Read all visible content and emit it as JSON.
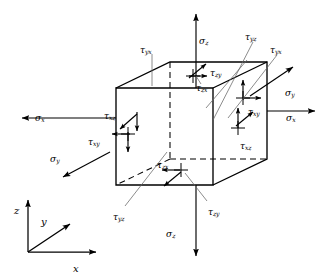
{
  "figure": {
    "type": "stress-element-diagram",
    "background_color": "#ffffff",
    "line_color": "#000000",
    "leader_color": "#555555"
  },
  "axes": {
    "name": "coordinate-triad",
    "origin": {
      "x": 28,
      "y": 252
    },
    "labels": [
      {
        "id": "z",
        "base": "z",
        "sub": "",
        "x": 14,
        "y": 206,
        "dir": "up"
      },
      {
        "id": "y",
        "base": "y",
        "sub": "",
        "x": 41,
        "y": 217,
        "dir": "up-right"
      },
      {
        "id": "x",
        "base": "x",
        "sub": "",
        "x": 73,
        "y": 264,
        "dir": "right"
      }
    ]
  },
  "cube": {
    "name": "stress-cube",
    "front_face": {
      "left": 116,
      "right": 213,
      "top": 88,
      "bottom": 185
    },
    "depth_offset": {
      "dx": 54,
      "dy": -26
    },
    "hidden_edges_style": "dashed"
  },
  "stress_labels": [
    {
      "id": "sigma-z-top",
      "base": "σ",
      "sub": "z",
      "x": 199,
      "y": 37,
      "face": "top",
      "kind": "normal"
    },
    {
      "id": "tau-yx-top",
      "base": "τ",
      "sub": "yx",
      "x": 140,
      "y": 46,
      "face": "back",
      "kind": "shear"
    },
    {
      "id": "tau-zy-top",
      "base": "τ",
      "sub": "zy",
      "x": 210,
      "y": 69,
      "face": "top",
      "kind": "shear"
    },
    {
      "id": "tau-zx-top",
      "base": "τ",
      "sub": "zx",
      "x": 196,
      "y": 84,
      "face": "top",
      "kind": "shear"
    },
    {
      "id": "tau-yz-right",
      "base": "τ",
      "sub": "yz",
      "x": 245,
      "y": 33,
      "face": "back",
      "kind": "shear"
    },
    {
      "id": "tau-yx-right",
      "base": "τ",
      "sub": "yx",
      "x": 270,
      "y": 46,
      "face": "back",
      "kind": "shear"
    },
    {
      "id": "sigma-y-right",
      "base": "σ",
      "sub": "y",
      "x": 285,
      "y": 89,
      "face": "right-rear",
      "kind": "normal"
    },
    {
      "id": "tau-xy-right",
      "base": "τ",
      "sub": "xy",
      "x": 248,
      "y": 108,
      "face": "right",
      "kind": "shear"
    },
    {
      "id": "sigma-x-right",
      "base": "σ",
      "sub": "x",
      "x": 286,
      "y": 114,
      "face": "right",
      "kind": "normal"
    },
    {
      "id": "tau-xz-right",
      "base": "τ",
      "sub": "xz",
      "x": 240,
      "y": 142,
      "face": "right",
      "kind": "shear"
    },
    {
      "id": "sigma-x-left",
      "base": "σ",
      "sub": "x",
      "x": 35,
      "y": 114,
      "face": "left",
      "kind": "normal"
    },
    {
      "id": "tau-xz-left",
      "base": "τ",
      "sub": "xz",
      "x": 104,
      "y": 112,
      "face": "left",
      "kind": "shear"
    },
    {
      "id": "tau-xy-left",
      "base": "τ",
      "sub": "xy",
      "x": 88,
      "y": 138,
      "face": "left",
      "kind": "shear"
    },
    {
      "id": "sigma-y-left",
      "base": "σ",
      "sub": "y",
      "x": 50,
      "y": 155,
      "face": "left-rear",
      "kind": "normal"
    },
    {
      "id": "tau-zx-bottom",
      "base": "τ",
      "sub": "zx",
      "x": 157,
      "y": 161,
      "face": "bottom",
      "kind": "shear"
    },
    {
      "id": "tau-yz-bottom",
      "base": "τ",
      "sub": "yz",
      "x": 113,
      "y": 213,
      "face": "front",
      "kind": "shear"
    },
    {
      "id": "tau-zy-bottom",
      "base": "τ",
      "sub": "zy",
      "x": 208,
      "y": 208,
      "face": "bottom",
      "kind": "shear"
    },
    {
      "id": "sigma-z-bottom",
      "base": "σ",
      "sub": "z",
      "x": 166,
      "y": 230,
      "face": "bottom",
      "kind": "normal"
    }
  ]
}
